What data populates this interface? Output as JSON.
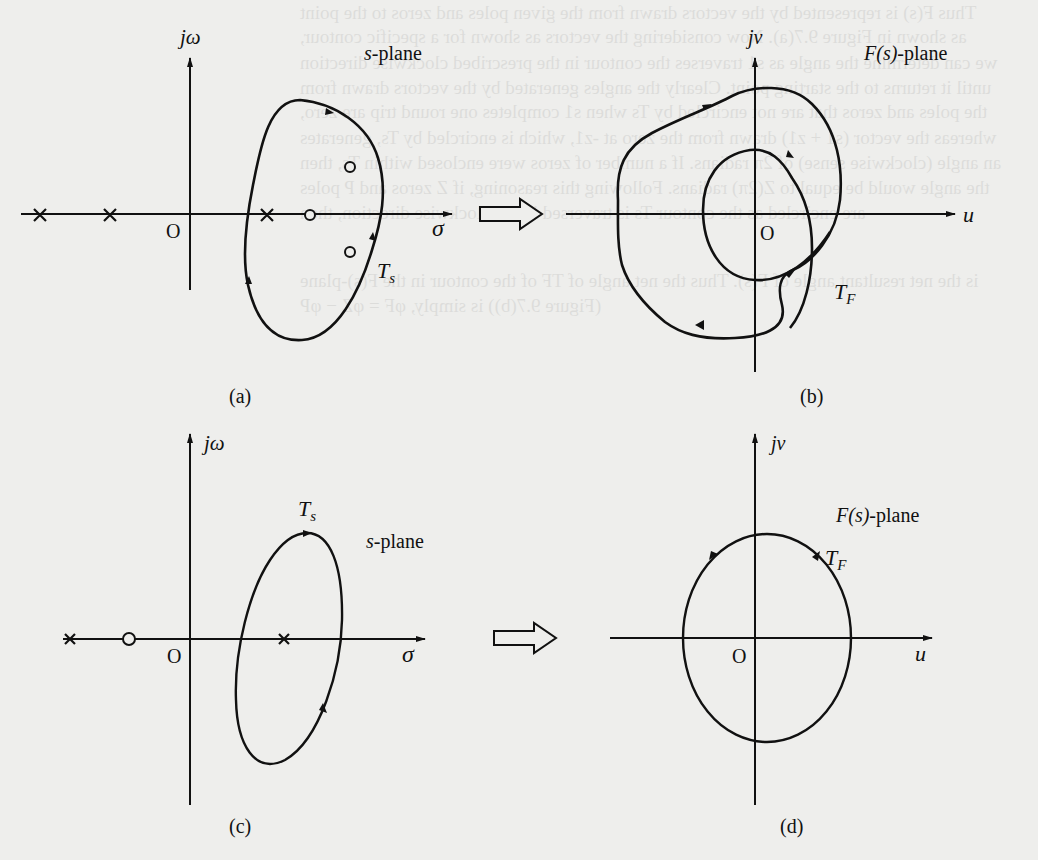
{
  "figure": {
    "stroke_color": "#111111",
    "background": "#eeeeec",
    "panels": [
      {
        "id": "a",
        "caption": "(a)",
        "plane_label_prefix": "s",
        "plane_label_suffix": "-plane",
        "vertical_axis_label": "jω",
        "horizontal_axis_label": "σ",
        "origin_label": "O",
        "contour_label": "T",
        "contour_label_sub": "s",
        "poles": [
          [
            40,
            215
          ],
          [
            110,
            215
          ],
          [
            267,
            215
          ]
        ],
        "zeros": [
          [
            310,
            215
          ],
          [
            350,
            167
          ],
          [
            350,
            252
          ]
        ],
        "direction": "clockwise"
      },
      {
        "id": "b",
        "caption": "(b)",
        "plane_label_prefix": "F(s)",
        "plane_label_suffix": "-plane",
        "vertical_axis_label": "jv",
        "horizontal_axis_label": "u",
        "origin_label": "O",
        "contour_label": "T",
        "contour_label_sub": "F",
        "direction": "clockwise, encircles origin twice"
      },
      {
        "id": "c",
        "caption": "(c)",
        "plane_label_prefix": "s",
        "plane_label_suffix": "-plane",
        "vertical_axis_label": "jω",
        "horizontal_axis_label": "σ",
        "origin_label": "O",
        "contour_label": "T",
        "contour_label_sub": "s",
        "poles": [
          [
            70,
            639
          ],
          [
            284,
            639
          ]
        ],
        "zeros": [
          [
            129,
            639
          ]
        ],
        "direction": "clockwise"
      },
      {
        "id": "d",
        "caption": "(d)",
        "plane_label_prefix": "F(s)",
        "plane_label_suffix": "-plane",
        "vertical_axis_label": "jv",
        "horizontal_axis_label": "u",
        "origin_label": "O",
        "contour_label": "T",
        "contour_label_sub": "F",
        "direction": "counterclockwise"
      }
    ],
    "mapping_arrows": [
      "a-to-b",
      "c-to-d"
    ]
  },
  "bleed_through_text": [
    "Thus F(s) is represented by the vectors drawn from the given poles and zeros to the point",
    "as shown in Figure 9.7(a). Now considering the vectors as shown for a specific contour,",
    "we can determine the angle as s1 traverses the contour in the prescribed clockwise direction",
    "until it returns to the starting point. Clearly the angles generated by the vectors drawn from",
    "the poles and zeros that are not encircled by Ts when s1 completes one round trip are zero,",
    "whereas the vector (s1 + z1) drawn from the zero at -z1, which is encircled by Ts, generates",
    "an angle (clockwise sense) of 2π radians. If a number of zeros were enclosed within Ts, then",
    "the angle would be equal to Z(2π) radians. Following this reasoning, if Z zeros and P poles",
    "are encircled as the contour Ts is traversed in the clockwise direction, then",
    "is the net resultant angle of F(s). Thus the net angle of TF of the contour in the F(s)-plane",
    "(Figure 9.7(b)) is simply, φF = φZ − φP"
  ]
}
